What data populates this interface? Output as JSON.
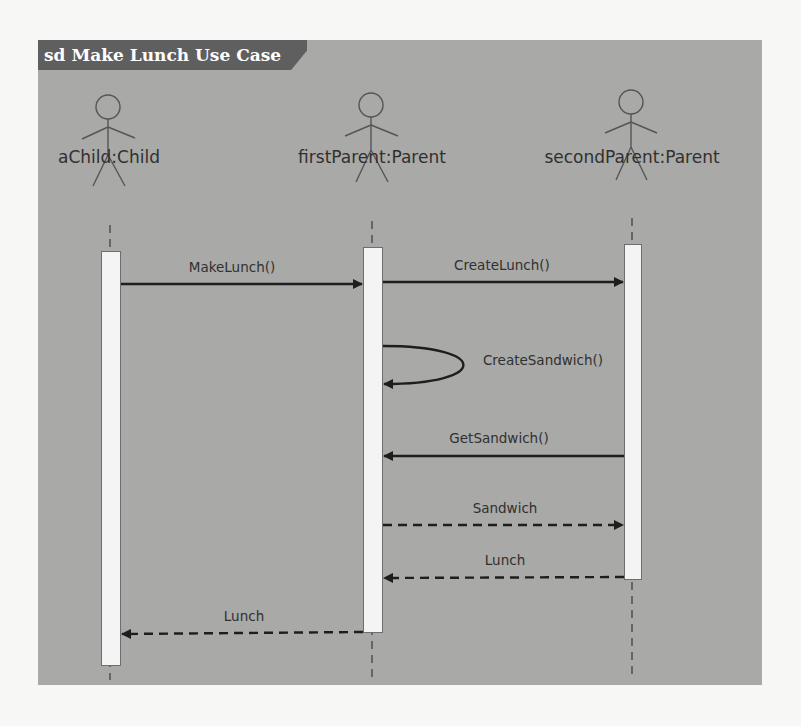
{
  "diagram": {
    "type": "UML sequence diagram",
    "frame_title": "sd Make Lunch Use Case",
    "colors": {
      "frame_background": "#a9a9a7",
      "title_tab": "#5f5f5f",
      "title_text": "#ffffff",
      "activation_fill": "#f4f4f4",
      "line": "#1e1e1e"
    },
    "lifelines": [
      {
        "id": "aChild",
        "label": "aChild:Child",
        "icon": "actor-stick-figure-icon"
      },
      {
        "id": "firstParent",
        "label": "firstParent:Parent",
        "icon": "actor-stick-figure-icon"
      },
      {
        "id": "secondParent",
        "label": "secondParent:Parent",
        "icon": "actor-stick-figure-icon"
      }
    ],
    "messages": [
      {
        "order": 1,
        "label": "MakeLunch()",
        "from": "aChild",
        "to": "firstParent",
        "kind": "synchronous call"
      },
      {
        "order": 2,
        "label": "CreateLunch()",
        "from": "firstParent",
        "to": "secondParent",
        "kind": "synchronous call"
      },
      {
        "order": 3,
        "label": "CreateSandwich()",
        "from": "firstParent",
        "to": "firstParent",
        "kind": "self call"
      },
      {
        "order": 4,
        "label": "GetSandwich()",
        "from": "secondParent",
        "to": "firstParent",
        "kind": "synchronous call"
      },
      {
        "order": 5,
        "label": "Sandwich",
        "from": "firstParent",
        "to": "secondParent",
        "kind": "return"
      },
      {
        "order": 6,
        "label": "Lunch",
        "from": "secondParent",
        "to": "firstParent",
        "kind": "return"
      },
      {
        "order": 7,
        "label": "Lunch",
        "from": "firstParent",
        "to": "aChild",
        "kind": "return"
      }
    ]
  }
}
